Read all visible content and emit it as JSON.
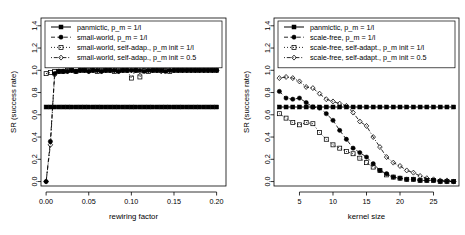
{
  "figure": {
    "panels": [
      {
        "id": "small-world",
        "xlabel": "rewiring factor",
        "ylabel": "SR (success rate)",
        "xticks": [
          "0.00",
          "0.05",
          "0.10",
          "0.15",
          "0.20"
        ],
        "xtickvals": [
          0.0,
          0.05,
          0.1,
          0.15,
          0.2
        ],
        "yticks": [
          "0.0",
          "0.2",
          "0.4",
          "0.6",
          "0.8",
          "1.0",
          "1.2",
          "1.4"
        ],
        "ytickvals": [
          0.0,
          0.2,
          0.4,
          0.6,
          0.8,
          1.0,
          1.2,
          1.4
        ],
        "xlim": [
          -0.006,
          0.211
        ],
        "ylim": [
          -0.04,
          1.47
        ],
        "legend": [
          {
            "label": "panmictic, p_m = 1/l",
            "marker": "filled-square",
            "dash": "solid"
          },
          {
            "label": "small-world, p_m = 1/l",
            "marker": "filled-circle",
            "dash": "dashed"
          },
          {
            "label": "small-world, self-adap., p_m init = 1/l",
            "marker": "open-square",
            "dash": "dotted"
          },
          {
            "label": "small-world, self-adap., p_m init = 0.5",
            "marker": "open-diamond",
            "dash": "dotdash"
          }
        ],
        "chart_data": {
          "type": "line",
          "title": "",
          "xlabel": "rewiring factor",
          "ylabel": "SR (success rate)",
          "xlim": [
            -0.006,
            0.211
          ],
          "ylim": [
            -0.04,
            1.47
          ],
          "grid": false,
          "legend_position": "top-left",
          "series": [
            {
              "name": "panmictic, p_m = 1/l",
              "marker": "filled-square",
              "dash": "solid",
              "x": [
                0.0,
                0.005,
                0.01,
                0.015,
                0.02,
                0.025,
                0.03,
                0.035,
                0.04,
                0.045,
                0.05,
                0.055,
                0.06,
                0.065,
                0.07,
                0.075,
                0.08,
                0.085,
                0.09,
                0.095,
                0.1,
                0.105,
                0.11,
                0.115,
                0.12,
                0.125,
                0.13,
                0.135,
                0.14,
                0.145,
                0.15,
                0.155,
                0.16,
                0.165,
                0.17,
                0.175,
                0.18,
                0.185,
                0.19,
                0.195,
                0.2
              ],
              "y": [
                0.67,
                0.67,
                0.67,
                0.67,
                0.67,
                0.67,
                0.67,
                0.67,
                0.67,
                0.67,
                0.67,
                0.67,
                0.67,
                0.67,
                0.67,
                0.67,
                0.67,
                0.67,
                0.67,
                0.67,
                0.67,
                0.67,
                0.67,
                0.67,
                0.67,
                0.67,
                0.67,
                0.67,
                0.67,
                0.67,
                0.67,
                0.67,
                0.67,
                0.67,
                0.67,
                0.67,
                0.67,
                0.67,
                0.67,
                0.67,
                0.67
              ]
            },
            {
              "name": "small-world, p_m = 1/l",
              "marker": "filled-circle",
              "dash": "dashed",
              "x": [
                0.0,
                0.005,
                0.01,
                0.015,
                0.02,
                0.025,
                0.03,
                0.035,
                0.04,
                0.045,
                0.05,
                0.055,
                0.06,
                0.065,
                0.07,
                0.075,
                0.08,
                0.085,
                0.09,
                0.095,
                0.1,
                0.105,
                0.11,
                0.115,
                0.12,
                0.125,
                0.13,
                0.135,
                0.14,
                0.145,
                0.15,
                0.155,
                0.16,
                0.165,
                0.17,
                0.175,
                0.18,
                0.185,
                0.19,
                0.195,
                0.2
              ],
              "y": [
                0.0,
                0.36,
                0.97,
                0.99,
                0.99,
                0.99,
                1.0,
                0.99,
                1.0,
                1.0,
                0.99,
                1.0,
                1.0,
                0.99,
                1.0,
                1.0,
                1.0,
                0.99,
                1.0,
                1.0,
                1.0,
                1.0,
                1.0,
                0.99,
                1.0,
                1.0,
                1.0,
                1.0,
                0.99,
                1.0,
                1.0,
                1.0,
                1.0,
                1.0,
                1.0,
                1.0,
                1.0,
                1.0,
                1.0,
                1.0,
                1.0
              ]
            },
            {
              "name": "small-world, self-adap., p_m init = 1/l",
              "marker": "open-square",
              "dash": "dotted",
              "x": [
                0.0,
                0.005,
                0.01,
                0.015,
                0.02,
                0.025,
                0.03,
                0.035,
                0.04,
                0.045,
                0.05,
                0.055,
                0.06,
                0.065,
                0.07,
                0.075,
                0.08,
                0.085,
                0.09,
                0.095,
                0.1,
                0.105,
                0.11,
                0.115,
                0.12,
                0.125,
                0.13,
                0.135,
                0.14,
                0.145,
                0.15,
                0.155,
                0.16,
                0.165,
                0.17,
                0.175,
                0.18,
                0.185,
                0.19,
                0.195,
                0.2
              ],
              "y": [
                0.97,
                0.98,
                0.99,
                0.99,
                0.99,
                1.0,
                1.0,
                0.99,
                1.0,
                1.0,
                1.0,
                1.0,
                0.99,
                1.0,
                1.0,
                1.0,
                0.99,
                1.0,
                1.0,
                1.0,
                0.93,
                1.0,
                0.94,
                1.0,
                0.99,
                1.0,
                1.0,
                1.0,
                1.0,
                0.99,
                1.0,
                1.0,
                1.0,
                1.0,
                1.0,
                1.0,
                1.0,
                1.0,
                1.0,
                1.0,
                1.0
              ]
            },
            {
              "name": "small-world, self-adap., p_m init = 0.5",
              "marker": "open-diamond",
              "dash": "dotdash",
              "x": [
                0.0,
                0.005,
                0.01,
                0.015,
                0.02,
                0.025,
                0.03,
                0.035,
                0.04,
                0.045,
                0.05,
                0.055,
                0.06,
                0.065,
                0.07,
                0.075,
                0.08,
                0.085,
                0.09,
                0.095,
                0.1,
                0.105,
                0.11,
                0.115,
                0.12,
                0.125,
                0.13,
                0.135,
                0.14,
                0.145,
                0.15,
                0.155,
                0.16,
                0.165,
                0.17,
                0.175,
                0.18,
                0.185,
                0.19,
                0.195,
                0.2
              ],
              "y": [
                0.0,
                0.33,
                0.96,
                0.99,
                0.99,
                0.99,
                1.0,
                0.99,
                1.0,
                1.0,
                0.99,
                1.0,
                1.0,
                0.99,
                1.0,
                1.0,
                1.0,
                0.99,
                1.0,
                1.0,
                1.0,
                1.0,
                0.99,
                1.0,
                1.0,
                1.0,
                1.0,
                0.99,
                1.0,
                1.0,
                1.0,
                1.0,
                1.0,
                1.0,
                1.0,
                1.0,
                1.0,
                1.0,
                1.0,
                1.0,
                1.0
              ]
            }
          ]
        }
      },
      {
        "id": "scale-free",
        "xlabel": "kernel size",
        "ylabel": "SR (success rate)",
        "xticks": [
          "5",
          "10",
          "15",
          "20",
          "25"
        ],
        "xtickvals": [
          5,
          10,
          15,
          20,
          25
        ],
        "yticks": [
          "0.0",
          "0.2",
          "0.4",
          "0.6",
          "0.8",
          "1.0",
          "1.2",
          "1.4"
        ],
        "ytickvals": [
          0.0,
          0.2,
          0.4,
          0.6,
          0.8,
          1.0,
          1.2,
          1.4
        ],
        "xlim": [
          1.2,
          28.8
        ],
        "ylim": [
          -0.04,
          1.47
        ],
        "legend": [
          {
            "label": "panmictic, p_m = 1/l",
            "marker": "filled-square",
            "dash": "solid"
          },
          {
            "label": "scale-free, p_m = 1/l",
            "marker": "filled-circle",
            "dash": "dashed"
          },
          {
            "label": "scale-free, self-adapt., p_m init = 1/l",
            "marker": "open-square",
            "dash": "dotted"
          },
          {
            "label": "scale-free, self-adapt., p_m init = 0.5",
            "marker": "open-diamond",
            "dash": "dotdash"
          }
        ],
        "chart_data": {
          "type": "line",
          "title": "",
          "xlabel": "kernel size",
          "ylabel": "SR (success rate)",
          "xlim": [
            1.2,
            28.8
          ],
          "ylim": [
            -0.04,
            1.47
          ],
          "grid": false,
          "legend_position": "top-left",
          "series": [
            {
              "name": "panmictic, p_m = 1/l",
              "marker": "filled-square",
              "dash": "solid",
              "x": [
                2,
                3,
                4,
                5,
                6,
                7,
                8,
                9,
                10,
                11,
                12,
                13,
                14,
                15,
                16,
                17,
                18,
                19,
                20,
                21,
                22,
                23,
                24,
                25,
                26,
                27,
                28
              ],
              "y": [
                0.67,
                0.67,
                0.67,
                0.67,
                0.67,
                0.67,
                0.67,
                0.67,
                0.67,
                0.67,
                0.67,
                0.67,
                0.67,
                0.67,
                0.67,
                0.67,
                0.67,
                0.67,
                0.67,
                0.67,
                0.67,
                0.67,
                0.67,
                0.67,
                0.67,
                0.67,
                0.67
              ]
            },
            {
              "name": "scale-free, p_m = 1/l",
              "marker": "filled-circle",
              "dash": "dashed",
              "x": [
                2,
                3,
                4,
                5,
                6,
                7,
                8,
                9,
                10,
                11,
                12,
                13,
                14,
                15,
                16,
                17,
                18,
                19,
                20,
                21,
                22,
                23,
                24,
                25,
                26,
                27,
                28
              ],
              "y": [
                0.81,
                0.75,
                0.74,
                0.75,
                0.71,
                0.67,
                0.66,
                0.61,
                0.55,
                0.46,
                0.38,
                0.3,
                0.26,
                0.22,
                0.16,
                0.1,
                0.07,
                0.04,
                0.03,
                0.02,
                0.02,
                0.01,
                0.01,
                0.01,
                0.0,
                0.0,
                0.0
              ]
            },
            {
              "name": "scale-free, self-adapt., p_m init = 1/l",
              "marker": "open-square",
              "dash": "dotted",
              "x": [
                2,
                3,
                4,
                5,
                6,
                7,
                8,
                9,
                10,
                11,
                12,
                13,
                14,
                15,
                16,
                17,
                18,
                19,
                20,
                21,
                22,
                23,
                24,
                25,
                26,
                27,
                28
              ],
              "y": [
                0.61,
                0.57,
                0.53,
                0.51,
                0.53,
                0.52,
                0.44,
                0.38,
                0.33,
                0.3,
                0.27,
                0.25,
                0.21,
                0.17,
                0.13,
                0.1,
                0.06,
                0.04,
                0.03,
                0.02,
                0.02,
                0.01,
                0.01,
                0.01,
                0.0,
                0.0,
                0.0
              ]
            },
            {
              "name": "scale-free, self-adapt., p_m init = 0.5",
              "marker": "open-diamond",
              "dash": "dotdash",
              "x": [
                2,
                3,
                4,
                5,
                6,
                7,
                8,
                9,
                10,
                11,
                12,
                13,
                14,
                15,
                16,
                17,
                18,
                19,
                20,
                21,
                22,
                23,
                24,
                25,
                26,
                27,
                28
              ],
              "y": [
                0.93,
                0.94,
                0.93,
                0.9,
                0.85,
                0.84,
                0.79,
                0.74,
                0.72,
                0.7,
                0.68,
                0.62,
                0.54,
                0.5,
                0.4,
                0.31,
                0.22,
                0.17,
                0.14,
                0.1,
                0.08,
                0.05,
                0.03,
                0.02,
                0.01,
                0.01,
                0.0
              ]
            }
          ]
        }
      }
    ]
  }
}
